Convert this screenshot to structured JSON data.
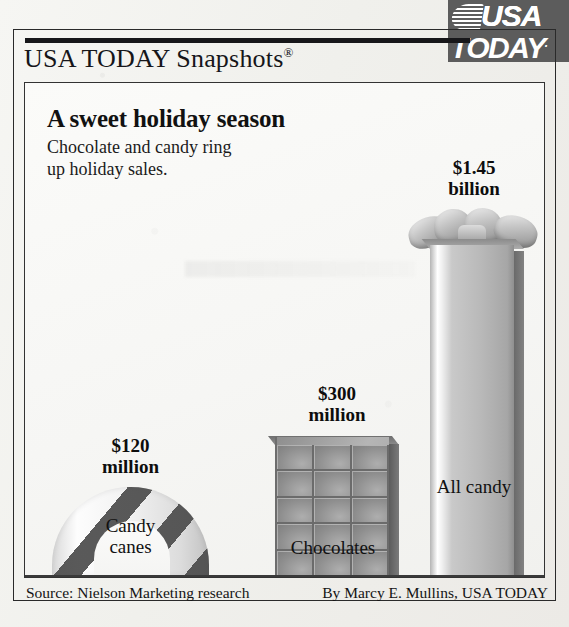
{
  "brand": {
    "logo_name": "usa-today-logo",
    "logo_line1": "USA",
    "logo_line2": "TODAY",
    "logo_period": ".",
    "logo_bg": "#5c5c5c"
  },
  "header": {
    "series_title": "USA TODAY Snapshots",
    "registered_mark": "®"
  },
  "main": {
    "headline": "A sweet holiday season",
    "subhead_line1": "Chocolate and candy ring",
    "subhead_line2": "up holiday sales."
  },
  "footer": {
    "source": "Source: Nielson Marketing research",
    "byline": "By Marcy E. Mullins, USA TODAY"
  },
  "chart_data": {
    "type": "bar",
    "title": "A sweet holiday season",
    "subtitle": "Chocolate and candy ring up holiday sales.",
    "xlabel": "",
    "ylabel": "",
    "grid": false,
    "legend": "none",
    "source": "Nielson Marketing research",
    "credit": "By Marcy E. Mullins, USA TODAY",
    "categories": [
      "Candy canes",
      "Chocolates",
      "All candy"
    ],
    "value_labels": [
      "$120 million",
      "$300 million",
      "$1.45 billion"
    ],
    "values": [
      120,
      300,
      1450
    ],
    "units": "USD millions",
    "ylim": [
      0,
      1450
    ],
    "bars": [
      {
        "label_line1": "Candy",
        "label_line2": "canes",
        "value_line1": "$120",
        "value_line2": "million",
        "value": 120,
        "icon": "candy-cane-arch"
      },
      {
        "label_line1": "Chocolates",
        "label_line2": "",
        "value_line1": "$300",
        "value_line2": "million",
        "value": 300,
        "icon": "chocolate-bar-grid"
      },
      {
        "label_line1": "All candy",
        "label_line2": "",
        "value_line1": "$1.45",
        "value_line2": "billion",
        "value": 1450,
        "icon": "gift-ribbon-column"
      }
    ]
  },
  "colors": {
    "ink": "#141414",
    "logo_gray": "#5c5c5c",
    "bar_gray": "#b4b4b4",
    "stripe_dark": "#4b4b4b",
    "panel_bg": "#fbfbf9"
  }
}
